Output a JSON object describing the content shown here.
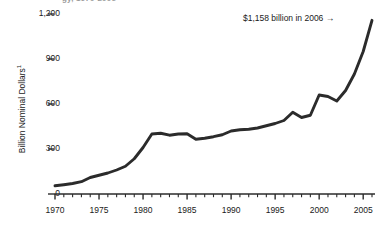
{
  "figure": {
    "title_fragment": "gy, 1970-2006",
    "background_color": "#ffffff",
    "line_color": "#2b2b2b",
    "text_color": "#1a1a1a"
  },
  "annotation": {
    "text": "$1,158 billion in 2006",
    "arrow_glyph": "→",
    "arrow_icon_name": "right-arrow-icon"
  },
  "axes": {
    "y_title": "Billion Nominal Dollars",
    "y_title_superscript": "1",
    "y_tick_labels": [
      "1,200",
      "900",
      "600",
      "300",
      "0"
    ],
    "y_tick_values": [
      1200,
      900,
      600,
      300,
      0
    ],
    "x_tick_labels": [
      "1970",
      "1975",
      "1980",
      "1985",
      "1990",
      "1995",
      "2000",
      "2005"
    ],
    "x_tick_values": [
      1970,
      1975,
      1980,
      1985,
      1990,
      1995,
      2000,
      2005
    ]
  },
  "chart_data": {
    "type": "line",
    "title": "gy, 1970-2006",
    "xlabel": "",
    "ylabel": "Billion Nominal Dollars",
    "ylim": [
      0,
      1200
    ],
    "xlim": [
      1970,
      2006
    ],
    "grid": false,
    "legend": "none",
    "annotations": [
      {
        "text": "$1,158 billion in 2006",
        "points_to_x": 2006,
        "points_to_y": 1158
      }
    ],
    "x": [
      1970,
      1971,
      1972,
      1973,
      1974,
      1975,
      1976,
      1977,
      1978,
      1979,
      1980,
      1981,
      1982,
      1983,
      1984,
      1985,
      1986,
      1987,
      1988,
      1989,
      1990,
      1991,
      1992,
      1993,
      1994,
      1995,
      1996,
      1997,
      1998,
      1999,
      2000,
      2001,
      2002,
      2003,
      2004,
      2005,
      2006
    ],
    "values": [
      55,
      62,
      70,
      82,
      110,
      125,
      140,
      160,
      185,
      235,
      310,
      400,
      405,
      392,
      400,
      402,
      365,
      372,
      382,
      395,
      420,
      428,
      432,
      440,
      455,
      470,
      490,
      545,
      510,
      525,
      660,
      650,
      620,
      690,
      800,
      950,
      1158
    ],
    "series": [
      {
        "name": "Billion Nominal Dollars",
        "values": [
          55,
          62,
          70,
          82,
          110,
          125,
          140,
          160,
          185,
          235,
          310,
          400,
          405,
          392,
          400,
          402,
          365,
          372,
          382,
          395,
          420,
          428,
          432,
          440,
          455,
          470,
          490,
          545,
          510,
          525,
          660,
          650,
          620,
          690,
          800,
          950,
          1158
        ]
      }
    ]
  }
}
